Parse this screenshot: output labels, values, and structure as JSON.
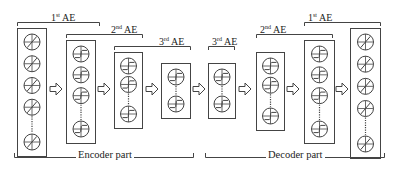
{
  "diagram": {
    "type": "stacked-autoencoder-architecture",
    "stroke_color": "#444444",
    "background": "#ffffff",
    "encoder": {
      "label": "Encoder part",
      "layers": [
        {
          "id": "enc-input",
          "neurons_shown": 5,
          "ellipsis_before_last": true,
          "box": [
            17,
            28,
            29,
            128
          ]
        },
        {
          "id": "enc-hidden-1",
          "neurons_shown": 4,
          "ellipsis_before_last": true,
          "box": [
            66,
            40,
            29,
            103
          ]
        },
        {
          "id": "enc-hidden-2",
          "neurons_shown": 3,
          "ellipsis_before_last": true,
          "box": [
            114,
            52,
            28,
            76
          ]
        },
        {
          "id": "enc-code",
          "neurons_shown": 2,
          "ellipsis_before_last": true,
          "box": [
            161,
            63,
            29,
            55
          ]
        }
      ],
      "brackets": [
        {
          "label_num": "1",
          "label_sup": "st",
          "label_text": " AE",
          "x1": 17,
          "x2": 99,
          "y": 22
        },
        {
          "label_num": "2",
          "label_sup": "nd",
          "label_text": " AE",
          "x1": 66,
          "x2": 142,
          "y": 34
        },
        {
          "label_num": "3",
          "label_sup": "rd",
          "label_text": " AE",
          "x1": 114,
          "x2": 190,
          "y": 46
        }
      ]
    },
    "decoder": {
      "label": "Decoder part",
      "layers": [
        {
          "id": "dec-code",
          "neurons_shown": 2,
          "ellipsis_before_last": true,
          "box": [
            208,
            63,
            27,
            55
          ]
        },
        {
          "id": "dec-hidden-2",
          "neurons_shown": 3,
          "ellipsis_before_last": true,
          "box": [
            256,
            52,
            28,
            78
          ]
        },
        {
          "id": "dec-hidden-1",
          "neurons_shown": 4,
          "ellipsis_before_last": true,
          "box": [
            304,
            40,
            30,
            103
          ]
        },
        {
          "id": "dec-output",
          "neurons_shown": 5,
          "ellipsis_before_last": true,
          "box": [
            350,
            28,
            30,
            130
          ]
        }
      ],
      "brackets": [
        {
          "label_num": "3",
          "label_sup": "rd",
          "label_text": " AE",
          "x1": 208,
          "x2": 234,
          "y": 46
        },
        {
          "label_num": "2",
          "label_sup": "nd",
          "label_text": " AE",
          "x1": 256,
          "x2": 332,
          "y": 34
        },
        {
          "label_num": "1",
          "label_sup": "st",
          "label_text": " AE",
          "x1": 304,
          "x2": 380,
          "y": 22
        }
      ]
    },
    "arrows": [
      {
        "x": 50,
        "y": 89
      },
      {
        "x": 98,
        "y": 89
      },
      {
        "x": 146,
        "y": 89
      },
      {
        "x": 193,
        "y": 89
      },
      {
        "x": 239,
        "y": 89
      },
      {
        "x": 287,
        "y": 89
      },
      {
        "x": 336,
        "y": 89
      }
    ],
    "part_brackets": {
      "encoder": {
        "x1": 14,
        "x2": 193,
        "y": 157
      },
      "decoder": {
        "x1": 205,
        "x2": 384,
        "y": 157
      }
    }
  },
  "labels": {
    "enc_1st": {
      "num": "1",
      "sup": "st",
      "text": " AE"
    },
    "enc_2nd": {
      "num": "2",
      "sup": "nd",
      "text": " AE"
    },
    "enc_3rd": {
      "num": "3",
      "sup": "rd",
      "text": " AE"
    },
    "dec_3rd": {
      "num": "3",
      "sup": "rd",
      "text": " AE"
    },
    "dec_2nd": {
      "num": "2",
      "sup": "nd",
      "text": " AE"
    },
    "dec_1st": {
      "num": "1",
      "sup": "st",
      "text": " AE"
    },
    "encoder_part": "Encoder part",
    "decoder_part": "Decoder part"
  }
}
